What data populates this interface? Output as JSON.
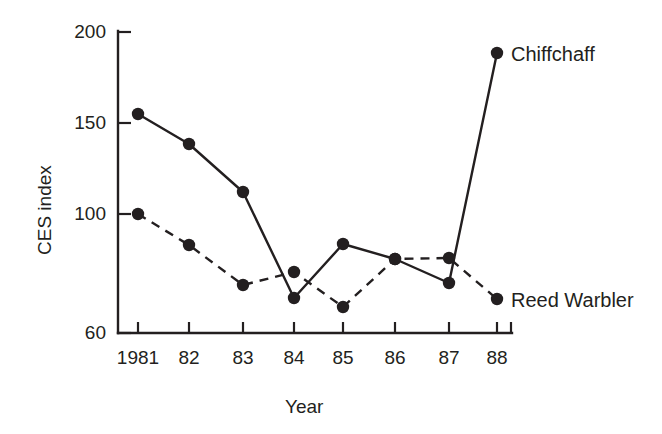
{
  "figure": {
    "background_color": "#ffffff",
    "ink_color": "#231f20"
  },
  "chart_data": {
    "type": "line",
    "title": "",
    "xlabel": "Year",
    "ylabel": "CES index",
    "categories": [
      "1981",
      "82",
      "83",
      "84",
      "85",
      "86",
      "87",
      "88"
    ],
    "x": [
      1981,
      1982,
      1983,
      1984,
      1985,
      1986,
      1987,
      1988
    ],
    "yticks": [
      60,
      100,
      150,
      200
    ],
    "ytick_labels": [
      "60",
      "100",
      "150",
      "200"
    ],
    "ylim": [
      60,
      200
    ],
    "axis_break_below": 100,
    "grid": false,
    "legend": "inline-right",
    "series": [
      {
        "name": "Chiffchaff",
        "style": "solid",
        "marker": "filled-circle",
        "values": [
          160,
          145,
          120,
          68,
          96,
          88,
          76,
          190
        ],
        "y_pixels": [
          114,
          144,
          192,
          298,
          244,
          259,
          283,
          53
        ]
      },
      {
        "name": "Reed Warbler",
        "style": "dashed",
        "marker": "filled-circle",
        "values": [
          109,
          92,
          75,
          81,
          65,
          88,
          89,
          68
        ],
        "y_pixels": [
          214,
          245,
          285,
          272,
          307,
          259,
          258,
          299
        ]
      }
    ],
    "x_pixels": [
      138,
      189,
      243,
      294,
      343,
      395,
      449,
      497
    ],
    "annotations": [
      {
        "text": "Chiffchaff",
        "x_px": 511,
        "y_px": 43
      },
      {
        "text": "Reed Warbler",
        "x_px": 511,
        "y_px": 289
      }
    ]
  },
  "axes": {
    "y_title": "CES index",
    "x_title": "Year",
    "y_tick_labels": [
      {
        "text": "200",
        "y_px": 22
      },
      {
        "text": "150",
        "y_px": 113
      },
      {
        "text": "100",
        "y_px": 204
      },
      {
        "text": "60",
        "y_px": 323
      }
    ],
    "x_tick_labels": [
      {
        "text": "1981",
        "x_px": 138
      },
      {
        "text": "82",
        "x_px": 189
      },
      {
        "text": "83",
        "x_px": 243
      },
      {
        "text": "84",
        "x_px": 294
      },
      {
        "text": "85",
        "x_px": 343
      },
      {
        "text": "86",
        "x_px": 395
      },
      {
        "text": "87",
        "x_px": 449
      },
      {
        "text": "88",
        "x_px": 497
      }
    ]
  }
}
